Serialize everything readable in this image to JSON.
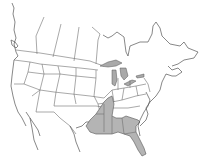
{
  "map": {
    "type": "species range map",
    "region": "North America (Canada, United States, northern Mexico)",
    "background_color": "#ffffff",
    "border_color": "#6e6e6e",
    "range_fill_color": "#b4b4b4",
    "lake_fill_color": "#a9a9a9",
    "highlighted_region": "Southeastern United States",
    "highlighted_states": [
      "Louisiana",
      "Mississippi",
      "Alabama",
      "Georgia",
      "Florida",
      "Arkansas (eastern)",
      "Tennessee (western)",
      "Kentucky (western)",
      "Texas (eastern edge)"
    ]
  }
}
